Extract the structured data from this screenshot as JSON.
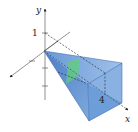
{
  "figure": {
    "type": "3d-solid-diagram",
    "axes": {
      "y_label": "y",
      "x_label": "x"
    },
    "labels": {
      "height_tick": "1",
      "length_label": "4"
    },
    "colors": {
      "solid_dark": "#3f79c4",
      "solid_mid": "#6a9ed8",
      "solid_light": "#a9c8ec",
      "slice": "#5fcf7a",
      "axis": "#333333",
      "dashed": "#333333"
    }
  }
}
